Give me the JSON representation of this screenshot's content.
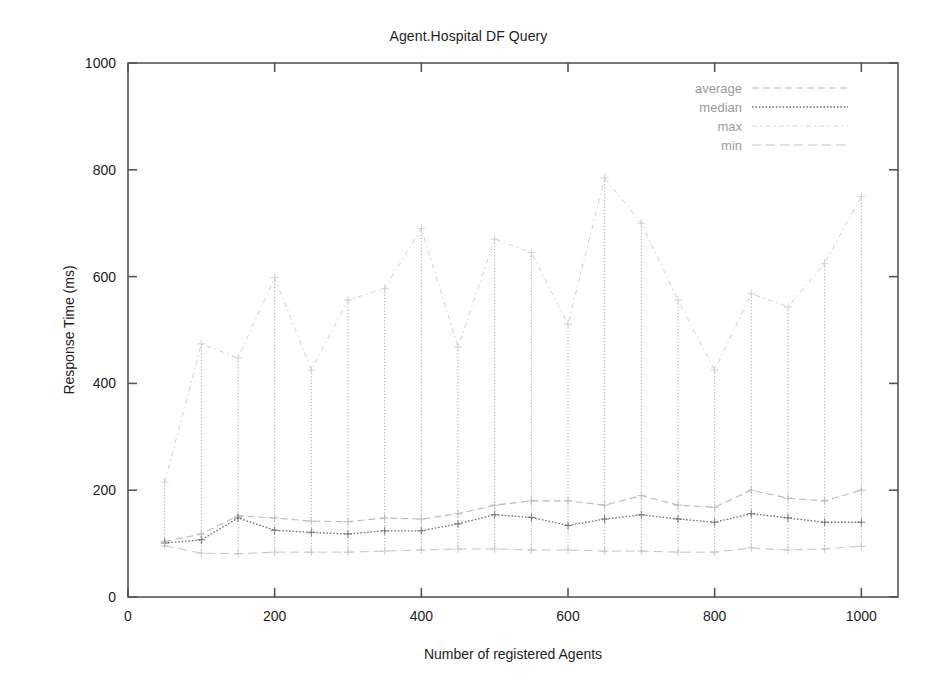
{
  "chart_data": {
    "type": "line",
    "title": "Agent.Hospital DF Query",
    "xlabel": "Number of registered Agents",
    "ylabel": "Response Time (ms)",
    "xlim": [
      0,
      1050
    ],
    "ylim": [
      0,
      1000
    ],
    "xticks": [
      0,
      200,
      400,
      600,
      800,
      1000
    ],
    "yticks": [
      0,
      200,
      400,
      600,
      800,
      1000
    ],
    "xtick_labels": [
      "0",
      "200",
      "400",
      "600",
      "800",
      "1000"
    ],
    "ytick_labels": [
      "0",
      "200",
      "400",
      "600",
      "800",
      "1000"
    ],
    "grid": false,
    "legend_position": "top-right",
    "x": [
      50,
      100,
      150,
      200,
      250,
      300,
      350,
      400,
      450,
      500,
      550,
      600,
      650,
      700,
      750,
      800,
      850,
      900,
      950,
      1000
    ],
    "series": [
      {
        "name": "average",
        "values": [
          104,
          118,
          152,
          148,
          142,
          141,
          148,
          146,
          156,
          172,
          180,
          180,
          172,
          190,
          172,
          168,
          200,
          185,
          180,
          200
        ]
      },
      {
        "name": "median",
        "values": [
          101,
          107,
          148,
          125,
          121,
          118,
          124,
          124,
          137,
          154,
          149,
          134,
          146,
          154,
          146,
          140,
          156,
          148,
          140,
          140
        ]
      },
      {
        "name": "max",
        "values": [
          215,
          474,
          448,
          598,
          425,
          556,
          578,
          690,
          468,
          670,
          645,
          511,
          785,
          700,
          556,
          425,
          568,
          543,
          625,
          750
        ]
      },
      {
        "name": "min",
        "values": [
          96,
          82,
          81,
          84,
          84,
          84,
          86,
          88,
          90,
          90,
          88,
          88,
          86,
          86,
          84,
          84,
          92,
          88,
          90,
          95
        ]
      }
    ]
  },
  "legend": {
    "items": [
      {
        "label": "average"
      },
      {
        "label": "median"
      },
      {
        "label": "max"
      },
      {
        "label": "min"
      }
    ]
  },
  "colors": {
    "average": "#b9b9b9",
    "median": "#6e6e6e",
    "max": "#cfcfcf",
    "min": "#c4c4c4",
    "axis": "#555555",
    "text": "#1d1d1d",
    "legend_text": "#9a9a9a",
    "background": "#ffffff"
  }
}
